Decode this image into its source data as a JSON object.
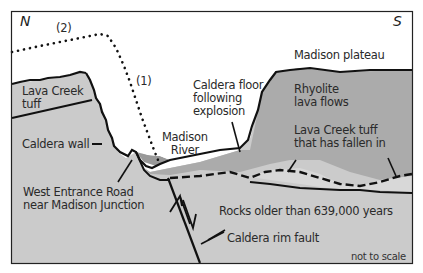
{
  "diagram": {
    "compass": {
      "north": "N",
      "south": "S"
    },
    "dotted_paths": [
      {
        "id": "path-1",
        "label": "(1)"
      },
      {
        "id": "path-2",
        "label": "(2)"
      }
    ],
    "labels": {
      "madison_plateau": "Madison plateau",
      "lava_creek_tuff_line1": "Lava Creek",
      "lava_creek_tuff_line2": "tuff",
      "caldera_wall": "Caldera wall",
      "caldera_floor_line1": "Caldera floor",
      "caldera_floor_line2": "following",
      "caldera_floor_line3": "explosion",
      "rhyolite_line1": "Rhyolite",
      "rhyolite_line2": "lava flows",
      "madison_river_line1": "Madison",
      "madison_river_line2": "River",
      "fallen_tuff_line1": "Lava Creek tuff",
      "fallen_tuff_line2": "that has fallen in",
      "west_entrance_line1": "West Entrance Road",
      "west_entrance_line2": "near Madison Junction",
      "older_rocks": "Rocks older than 639,000 years",
      "rim_fault": "Caldera rim fault",
      "scale_note": "not to scale"
    },
    "colors": {
      "background": "#ffffff",
      "frame": "#222222",
      "older_rock_fill": "#cbcbcb",
      "lava_creek_tuff_fill": "#cdcdcd",
      "rhyolite_fill": "#a9a9a9",
      "fallen_tuff_fill": "#d6d6d6",
      "river_fill": "#9c9c9c",
      "line": "#111111"
    }
  }
}
